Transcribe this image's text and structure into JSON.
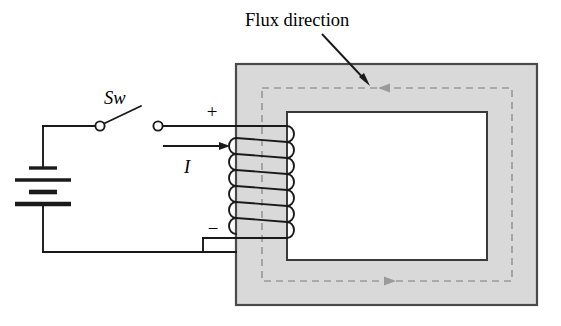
{
  "figure": {
    "type": "electrical-schematic"
  },
  "labels": {
    "flux_direction": "Flux direction",
    "switch": "Sw",
    "current": "I",
    "plus": "+",
    "minus": "−"
  },
  "colors": {
    "ink": "#1a1a1a",
    "core_fill": "#d9d9d9",
    "core_stroke": "#4a4a4a",
    "flux_dash": "#9a9a9a",
    "background": "#ffffff"
  },
  "core": {
    "outer": {
      "x": 236,
      "y": 64,
      "width": 301,
      "height": 241
    },
    "window": {
      "x": 287,
      "y": 112,
      "width": 200,
      "height": 148
    },
    "leg_width": 51
  },
  "flux_path": {
    "shape": "rectangle",
    "x": 262,
    "y": 88,
    "width": 250,
    "height": 193,
    "direction": "counterclockwise",
    "top_arrow": "left",
    "bottom_arrow": "right",
    "dash_pattern": "7 5"
  },
  "coil": {
    "turns": 7,
    "leg_x_left": 236,
    "leg_x_right": 287,
    "top_lead_y": 126,
    "bottom_lead_y": 238,
    "loop_radius": 7
  },
  "battery": {
    "x": 22,
    "plates": [
      {
        "y": 168,
        "half_width": 14,
        "thickness": 3
      },
      {
        "y": 180,
        "half_width": 28,
        "thickness": 3
      },
      {
        "y": 192,
        "half_width": 14,
        "thickness": 4
      },
      {
        "y": 204,
        "half_width": 28,
        "thickness": 4
      }
    ]
  },
  "switch": {
    "left_terminal": {
      "cx": 100,
      "cy": 126,
      "r": 4.5
    },
    "right_terminal": {
      "cx": 158,
      "cy": 126,
      "r": 4.5
    },
    "blade_end": {
      "x": 140,
      "y": 107
    }
  },
  "current_arrow": {
    "x1": 163,
    "x2": 228,
    "y": 146,
    "label_x": 182,
    "label_y": 170
  },
  "annotation_leader": {
    "from": {
      "x": 322,
      "y": 34
    },
    "to": {
      "x": 369,
      "y": 84
    }
  }
}
